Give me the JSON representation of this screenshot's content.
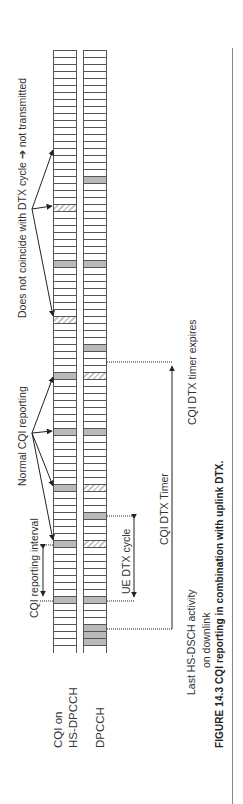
{
  "figure": {
    "caption": "FIGURE 14.3  CQI reporting in combination with uplink DTX.",
    "channels": [
      {
        "id": "cqi",
        "label_line1": "CQI on",
        "label_line2": "HS-DPCCH"
      },
      {
        "id": "dpcch",
        "label_line1": "DPCCH",
        "label_line2": ""
      }
    ],
    "annotations": {
      "not_coincide": "Does not coincide with DTX cycle ➔ not transmitted",
      "normal_cqi": "Normal CQI reporting",
      "cqi_interval": "CQI reporting interval",
      "ue_dtx_cycle": "UE DTX cycle",
      "cqi_dtx_timer": "CQI DTX Timer",
      "timer_expires": "CQI DTX timer expires",
      "last_hsdsch_line1": "Last HS-DSCH activity",
      "last_hsdsch_line2": "on downlink"
    },
    "slot_grid": {
      "top_px": 50,
      "slot_height_px": 7,
      "slot_count": 86
    },
    "cqi_slots": {
      "gray": [
        261,
        374,
        430,
        486,
        542,
        597
      ],
      "hatched": [
        148,
        205,
        317
      ]
    },
    "dpcch_slots": {
      "gray": [
        177,
        261,
        346,
        430,
        513,
        597,
        625,
        632,
        639
      ],
      "hatched": [
        374,
        486,
        542
      ]
    },
    "colors": {
      "line": "#555555",
      "gray_fill": "#b9b9b9",
      "hatch": "#c8c8c8",
      "text": "#333333"
    }
  }
}
